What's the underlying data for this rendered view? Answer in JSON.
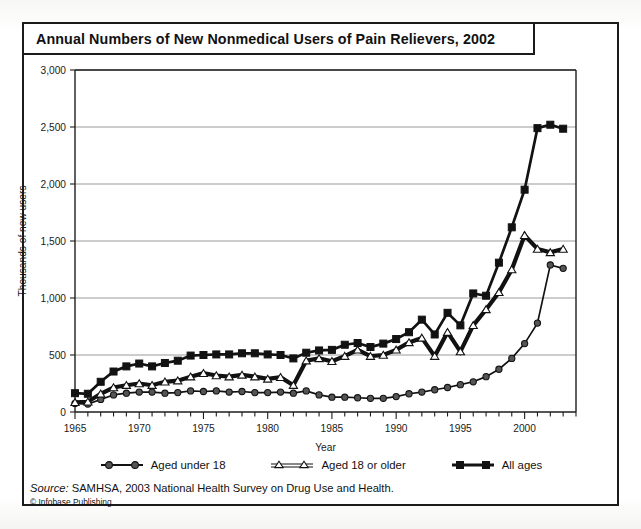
{
  "figure": {
    "title": "Annual Numbers of New Nonmedical Users of Pain Relievers, 2002",
    "source_prefix": "Source:",
    "source_text": " SAMHSA, 2003 National Health Survey on Drug Use and Health.",
    "copyright": "© Infobase Publishing"
  },
  "legend": {
    "items": [
      {
        "label": "Aged under 18",
        "marker": "filled-circle",
        "color": "#555555"
      },
      {
        "label": "Aged 18 or older",
        "marker": "open-triangle",
        "color": "#ffffff"
      },
      {
        "label": "All ages",
        "marker": "filled-square",
        "color": "#121212"
      }
    ]
  },
  "chart_data": {
    "type": "line",
    "title": "Annual Numbers of New Nonmedical Users of Pain Relievers, 2002",
    "xlabel": "Year",
    "ylabel": "Thousands of new users",
    "xlim": [
      1965,
      2004
    ],
    "ylim": [
      0,
      3000
    ],
    "yticks": [
      0,
      500,
      1000,
      1500,
      2000,
      2500,
      3000
    ],
    "ytick_labels": [
      "0",
      "500",
      "1,000",
      "1,500",
      "2,000",
      "2,500",
      "3,000"
    ],
    "xticks": [
      1965,
      1970,
      1975,
      1980,
      1985,
      1990,
      1995,
      2000
    ],
    "xtick_labels": [
      "1965",
      "1970",
      "1975",
      "1980",
      "1985",
      "1990",
      "1995",
      "2000"
    ],
    "minor_xticks_every": 1,
    "grid": "horizontal",
    "legend_position": "below",
    "x": [
      1965,
      1966,
      1967,
      1968,
      1969,
      1970,
      1971,
      1972,
      1973,
      1974,
      1975,
      1976,
      1977,
      1978,
      1979,
      1980,
      1981,
      1982,
      1983,
      1984,
      1985,
      1986,
      1987,
      1988,
      1989,
      1990,
      1991,
      1992,
      1993,
      1994,
      1995,
      1996,
      1997,
      1998,
      1999,
      2000,
      2001,
      2002,
      2003
    ],
    "series": [
      {
        "name": "Aged under 18",
        "marker": "filled-circle",
        "values": [
          75,
          70,
          110,
          150,
          165,
          175,
          175,
          165,
          170,
          185,
          180,
          185,
          175,
          180,
          170,
          170,
          175,
          165,
          185,
          150,
          130,
          130,
          125,
          120,
          120,
          135,
          160,
          175,
          195,
          215,
          240,
          265,
          310,
          375,
          470,
          600,
          780,
          1290,
          1260
        ]
      },
      {
        "name": "Aged 18 or older",
        "marker": "open-triangle",
        "values": [
          85,
          90,
          160,
          215,
          235,
          250,
          235,
          265,
          275,
          310,
          340,
          320,
          310,
          325,
          310,
          290,
          305,
          235,
          450,
          470,
          445,
          490,
          545,
          490,
          500,
          545,
          610,
          650,
          490,
          700,
          530,
          760,
          900,
          1050,
          1250,
          1550,
          1430,
          1400,
          1430
        ]
      },
      {
        "name": "All ages",
        "marker": "filled-square",
        "values": [
          165,
          160,
          265,
          355,
          400,
          425,
          400,
          430,
          450,
          495,
          500,
          505,
          505,
          515,
          515,
          505,
          500,
          470,
          520,
          540,
          545,
          590,
          605,
          570,
          600,
          640,
          700,
          810,
          680,
          870,
          760,
          1040,
          1020,
          1310,
          1620,
          1950,
          2490,
          2520,
          2485
        ]
      }
    ]
  }
}
